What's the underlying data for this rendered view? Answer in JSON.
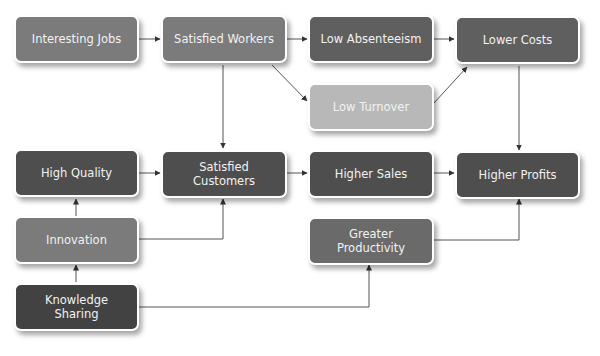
{
  "colors": {
    "medium": "#7b7b7b",
    "dark": "#5c5c5c",
    "darker": "#4a4a4a",
    "light": "#b8b8b8",
    "edge": "#555555"
  },
  "nodes": {
    "interesting_jobs": {
      "label": "Interesting Jobs"
    },
    "satisfied_workers": {
      "label": "Satisfied Workers"
    },
    "low_absenteeism": {
      "label": "Low Absenteeism"
    },
    "lower_costs": {
      "label": "Lower Costs"
    },
    "low_turnover": {
      "label": "Low Turnover"
    },
    "high_quality": {
      "label": "High Quality"
    },
    "satisfied_customers": {
      "label": "Satisfied Customers"
    },
    "higher_sales": {
      "label": "Higher Sales"
    },
    "higher_profits": {
      "label": "Higher Profits"
    },
    "innovation": {
      "label": "Innovation"
    },
    "greater_productivity": {
      "label": "Greater Productivity"
    },
    "knowledge_sharing": {
      "label": "Knowledge Sharing"
    }
  },
  "edges": [
    [
      "interesting_jobs",
      "satisfied_workers"
    ],
    [
      "satisfied_workers",
      "low_absenteeism"
    ],
    [
      "satisfied_workers",
      "low_turnover"
    ],
    [
      "satisfied_workers",
      "satisfied_customers"
    ],
    [
      "low_absenteeism",
      "lower_costs"
    ],
    [
      "low_turnover",
      "lower_costs"
    ],
    [
      "lower_costs",
      "higher_profits"
    ],
    [
      "high_quality",
      "satisfied_customers"
    ],
    [
      "satisfied_customers",
      "higher_sales"
    ],
    [
      "higher_sales",
      "higher_profits"
    ],
    [
      "innovation",
      "high_quality"
    ],
    [
      "innovation",
      "satisfied_customers"
    ],
    [
      "greater_productivity",
      "higher_profits"
    ],
    [
      "knowledge_sharing",
      "innovation"
    ],
    [
      "knowledge_sharing",
      "greater_productivity"
    ]
  ]
}
